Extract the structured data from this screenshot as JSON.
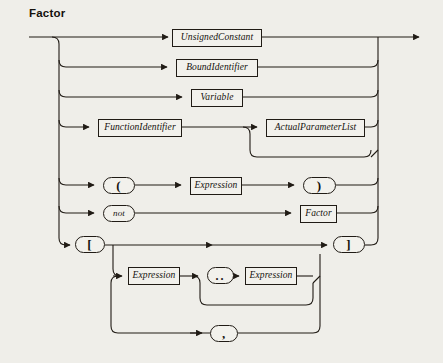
{
  "diagram": {
    "title": "Factor",
    "type": "railroad-syntax-diagram",
    "colors": {
      "background": "#efeee9",
      "line": "#201b15",
      "box_fill": "#f2f1ec",
      "text": "#15110c"
    },
    "nodes": [
      {
        "id": "unsigned-constant",
        "label": "UnsignedConstant",
        "shape": "box",
        "x": 172,
        "y": 29,
        "w": 90,
        "h": 18
      },
      {
        "id": "bound-identifier",
        "label": "BoundIdentifier",
        "shape": "box",
        "x": 176,
        "y": 59,
        "w": 82,
        "h": 18
      },
      {
        "id": "variable",
        "label": "Variable",
        "shape": "box",
        "x": 191,
        "y": 89,
        "w": 52,
        "h": 18
      },
      {
        "id": "function-identifier",
        "label": "FunctionIdentifier",
        "shape": "box",
        "x": 98,
        "y": 119,
        "w": 84,
        "h": 18
      },
      {
        "id": "actual-parameter-list",
        "label": "ActualParameterList",
        "shape": "box",
        "x": 266,
        "y": 119,
        "w": 99,
        "h": 18
      },
      {
        "id": "lparen",
        "label": "(",
        "shape": "oval",
        "variant": "punct",
        "x": 103,
        "y": 177,
        "w": 32,
        "h": 17
      },
      {
        "id": "expression-paren",
        "label": "Expression",
        "shape": "box",
        "x": 190,
        "y": 177,
        "w": 52,
        "h": 18
      },
      {
        "id": "rparen",
        "label": ")",
        "shape": "oval",
        "variant": "punct",
        "x": 303,
        "y": 177,
        "w": 33,
        "h": 17
      },
      {
        "id": "not-keyword",
        "label": "not",
        "shape": "oval",
        "variant": "kw",
        "x": 103,
        "y": 205,
        "w": 32,
        "h": 17
      },
      {
        "id": "factor-ref",
        "label": "Factor",
        "shape": "box",
        "x": 300,
        "y": 205,
        "w": 37,
        "h": 18
      },
      {
        "id": "lbracket",
        "label": "[",
        "shape": "oval",
        "variant": "punct",
        "x": 75,
        "y": 236,
        "w": 30,
        "h": 17
      },
      {
        "id": "rbracket",
        "label": "]",
        "shape": "oval",
        "variant": "punct",
        "x": 333,
        "y": 236,
        "w": 32,
        "h": 17
      },
      {
        "id": "expression-range-low",
        "label": "Expression",
        "shape": "box",
        "x": 128,
        "y": 267,
        "w": 52,
        "h": 18
      },
      {
        "id": "range-dots",
        "label": "..",
        "shape": "oval",
        "variant": "dots",
        "x": 207,
        "y": 267,
        "w": 27,
        "h": 17
      },
      {
        "id": "expression-range-high",
        "label": "Expression",
        "shape": "box",
        "x": 245,
        "y": 267,
        "w": 52,
        "h": 18
      },
      {
        "id": "comma-separator",
        "label": ",",
        "shape": "oval",
        "variant": "punct",
        "x": 210,
        "y": 325,
        "w": 28,
        "h": 17
      }
    ]
  }
}
